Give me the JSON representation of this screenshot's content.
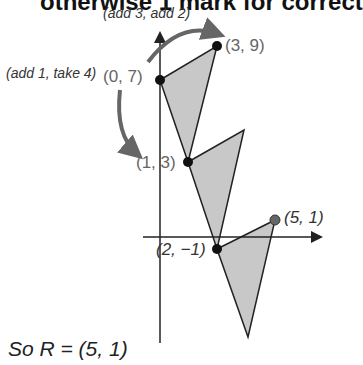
{
  "header": {
    "text": "otherwise 1 mark for correct"
  },
  "diagram": {
    "arrow_top_label": "(add 3, add 2)",
    "arrow_left_label": "(add 1, take 4)",
    "points": [
      {
        "label": "(0, 7)"
      },
      {
        "label": "(3, 9)"
      },
      {
        "label": "(1, 3)"
      },
      {
        "label": "(2, −1)"
      },
      {
        "label": "(5, 1)"
      }
    ],
    "colors": {
      "fill": "#c8c8c8",
      "stroke": "#222222",
      "arrow": "#666666",
      "point": "#111111",
      "final_point": "#555555"
    }
  },
  "answer": {
    "text": "So R = (5, 1)"
  }
}
